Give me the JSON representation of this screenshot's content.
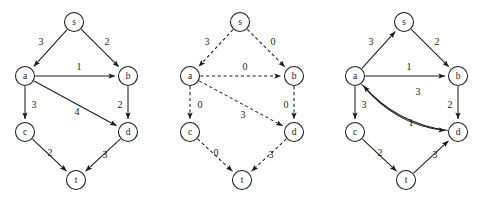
{
  "figure": {
    "background_color": "#ffffff",
    "ink_color": "#1a1a1a",
    "panel_count": 3
  },
  "panels": [
    {
      "id": "panel-original-graph",
      "name": "original-graph",
      "edge_style": "solid",
      "origin_x": 0,
      "nodes": [
        {
          "id": "s",
          "label": "s",
          "cx": 74,
          "cy": 22,
          "r": 9.5
        },
        {
          "id": "a",
          "label": "a",
          "cx": 25,
          "cy": 76,
          "r": 9.5
        },
        {
          "id": "b",
          "label": "b",
          "cx": 128,
          "cy": 76,
          "r": 9.5
        },
        {
          "id": "c",
          "label": "c",
          "cx": 25,
          "cy": 132,
          "r": 9.5
        },
        {
          "id": "d",
          "label": "d",
          "cx": 128,
          "cy": 132,
          "r": 9.5
        },
        {
          "id": "t",
          "label": "t",
          "cx": 76,
          "cy": 180,
          "r": 9.5
        }
      ],
      "edges": [
        {
          "id": "s-a",
          "from": "s",
          "to": "a",
          "weight": "3",
          "label_x": 41,
          "label_y": 41,
          "curve": 0
        },
        {
          "id": "s-b",
          "from": "s",
          "to": "b",
          "weight": "2",
          "label_x": 107,
          "label_y": 41,
          "curve": 0
        },
        {
          "id": "a-b",
          "from": "a",
          "to": "b",
          "weight": "1",
          "label_x": 79,
          "label_y": 66,
          "curve": 0
        },
        {
          "id": "a-c",
          "from": "a",
          "to": "c",
          "weight": "3",
          "label_x": 34,
          "label_y": 104,
          "curve": 0
        },
        {
          "id": "a-d",
          "from": "a",
          "to": "d",
          "weight": "4",
          "label_x": 77,
          "label_y": 111,
          "curve": 0
        },
        {
          "id": "b-d",
          "from": "b",
          "to": "d",
          "weight": "2",
          "label_x": 120,
          "label_y": 104,
          "curve": 0
        },
        {
          "id": "c-t",
          "from": "c",
          "to": "t",
          "weight": "2",
          "label_x": 50,
          "label_y": 152,
          "curve": 0
        },
        {
          "id": "d-t",
          "from": "d",
          "to": "t",
          "weight": "3",
          "label_x": 105,
          "label_y": 154,
          "curve": 0
        }
      ]
    },
    {
      "id": "panel-residual-graph",
      "name": "residual-graph",
      "edge_style": "dashed",
      "origin_x": 165,
      "nodes": [
        {
          "id": "s",
          "label": "s",
          "cx": 240,
          "cy": 22,
          "r": 9.5
        },
        {
          "id": "a",
          "label": "a",
          "cx": 190,
          "cy": 76,
          "r": 9.5
        },
        {
          "id": "b",
          "label": "b",
          "cx": 294,
          "cy": 76,
          "r": 9.5
        },
        {
          "id": "c",
          "label": "c",
          "cx": 190,
          "cy": 132,
          "r": 9.5
        },
        {
          "id": "d",
          "label": "d",
          "cx": 294,
          "cy": 132,
          "r": 9.5
        },
        {
          "id": "t",
          "label": "t",
          "cx": 242,
          "cy": 180,
          "r": 9.5
        }
      ],
      "edges": [
        {
          "id": "s-a",
          "from": "s",
          "to": "a",
          "weight": "3",
          "label_x": 207,
          "label_y": 41,
          "curve": 0
        },
        {
          "id": "s-b",
          "from": "s",
          "to": "b",
          "weight": "0",
          "label_x": 273,
          "label_y": 41,
          "curve": 0
        },
        {
          "id": "a-b",
          "from": "a",
          "to": "b",
          "weight": "0",
          "label_x": 245,
          "label_y": 66,
          "curve": 0
        },
        {
          "id": "a-c",
          "from": "a",
          "to": "c",
          "weight": "0",
          "label_x": 200,
          "label_y": 104,
          "curve": 0
        },
        {
          "id": "a-d",
          "from": "a",
          "to": "d",
          "weight": "3",
          "label_x": 243,
          "label_y": 114,
          "curve": 0
        },
        {
          "id": "b-d",
          "from": "b",
          "to": "d",
          "weight": "0",
          "label_x": 286,
          "label_y": 104,
          "curve": 0
        },
        {
          "id": "c-t",
          "from": "c",
          "to": "t",
          "weight": "0",
          "label_x": 216,
          "label_y": 152,
          "curve": 0
        },
        {
          "id": "d-t",
          "from": "d",
          "to": "t",
          "weight": "3",
          "label_x": 271,
          "label_y": 154,
          "curve": 0
        }
      ]
    },
    {
      "id": "panel-updated-graph",
      "name": "updated-graph",
      "edge_style": "solid",
      "origin_x": 330,
      "nodes": [
        {
          "id": "s",
          "label": "s",
          "cx": 404,
          "cy": 22,
          "r": 9.5
        },
        {
          "id": "a",
          "label": "a",
          "cx": 355,
          "cy": 76,
          "r": 9.5
        },
        {
          "id": "b",
          "label": "b",
          "cx": 458,
          "cy": 76,
          "r": 9.5
        },
        {
          "id": "c",
          "label": "c",
          "cx": 355,
          "cy": 132,
          "r": 9.5
        },
        {
          "id": "d",
          "label": "d",
          "cx": 458,
          "cy": 132,
          "r": 9.5
        },
        {
          "id": "t",
          "label": "t",
          "cx": 406,
          "cy": 180,
          "r": 9.5
        }
      ],
      "edges": [
        {
          "id": "a-s",
          "from": "a",
          "to": "s",
          "weight": "3",
          "label_x": 371,
          "label_y": 41,
          "curve": 0
        },
        {
          "id": "s-b",
          "from": "s",
          "to": "b",
          "weight": "2",
          "label_x": 437,
          "label_y": 41,
          "curve": 0
        },
        {
          "id": "a-b",
          "from": "a",
          "to": "b",
          "weight": "1",
          "label_x": 409,
          "label_y": 66,
          "curve": 0
        },
        {
          "id": "d-a",
          "from": "d",
          "to": "a",
          "weight": "3",
          "label_x": 418,
          "label_y": 91,
          "curve": -11
        },
        {
          "id": "a-c",
          "from": "a",
          "to": "c",
          "weight": "3",
          "label_x": 364,
          "label_y": 104,
          "curve": 0
        },
        {
          "id": "a-d",
          "from": "a",
          "to": "d",
          "weight": "1",
          "label_x": 411,
          "label_y": 122,
          "curve": 12
        },
        {
          "id": "b-d",
          "from": "b",
          "to": "d",
          "weight": "2",
          "label_x": 450,
          "label_y": 104,
          "curve": 0
        },
        {
          "id": "c-t",
          "from": "c",
          "to": "t",
          "weight": "2",
          "label_x": 380,
          "label_y": 152,
          "curve": 0
        },
        {
          "id": "t-d",
          "from": "t",
          "to": "d",
          "weight": "3",
          "label_x": 435,
          "label_y": 154,
          "curve": 0
        }
      ]
    }
  ]
}
